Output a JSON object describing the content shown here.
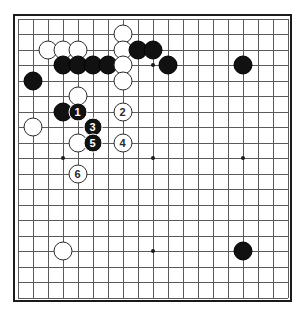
{
  "figure": {
    "kind": "go-board-diagram",
    "title": "",
    "board_size": 19,
    "colors": {
      "background": "#ffffff",
      "board": "#ffffff",
      "border": "#1b1b1b",
      "grid_line": "#5a5a5a",
      "black_stone": "#111111",
      "white_stone": "#ffffff",
      "white_stone_outline": "#2a2a2a",
      "star_point": "#1b1b1b",
      "black_label_text": "#ffffff",
      "white_label_text": "#2a2a2a"
    }
  },
  "chart_data": {
    "type": "table",
    "xlabel": "board column (0 = left edge, 18 = right edge)",
    "ylabel": "board row (0 = top edge, 18 = bottom edge)",
    "board_size": 19,
    "star_points": [
      {
        "col": 3,
        "row": 3
      },
      {
        "col": 9,
        "row": 3
      },
      {
        "col": 15,
        "row": 3
      },
      {
        "col": 3,
        "row": 9
      },
      {
        "col": 9,
        "row": 9
      },
      {
        "col": 15,
        "row": 9
      },
      {
        "col": 3,
        "row": 15
      },
      {
        "col": 9,
        "row": 15
      },
      {
        "col": 15,
        "row": 15
      }
    ],
    "stones": [
      {
        "color": "white",
        "col": 7,
        "row": 1,
        "label": ""
      },
      {
        "color": "white",
        "col": 2,
        "row": 2,
        "label": ""
      },
      {
        "color": "white",
        "col": 3,
        "row": 2,
        "label": ""
      },
      {
        "color": "white",
        "col": 4,
        "row": 2,
        "label": ""
      },
      {
        "color": "white",
        "col": 7,
        "row": 2,
        "label": ""
      },
      {
        "color": "black",
        "col": 8,
        "row": 2,
        "label": ""
      },
      {
        "color": "black",
        "col": 9,
        "row": 2,
        "label": ""
      },
      {
        "color": "black",
        "col": 3,
        "row": 3,
        "label": ""
      },
      {
        "color": "black",
        "col": 4,
        "row": 3,
        "label": ""
      },
      {
        "color": "black",
        "col": 5,
        "row": 3,
        "label": ""
      },
      {
        "color": "black",
        "col": 6,
        "row": 3,
        "label": ""
      },
      {
        "color": "white",
        "col": 7,
        "row": 3,
        "label": ""
      },
      {
        "color": "black",
        "col": 10,
        "row": 3,
        "label": ""
      },
      {
        "color": "black",
        "col": 15,
        "row": 3,
        "label": ""
      },
      {
        "color": "black",
        "col": 1,
        "row": 4,
        "label": ""
      },
      {
        "color": "white",
        "col": 7,
        "row": 4,
        "label": ""
      },
      {
        "color": "white",
        "col": 4,
        "row": 5,
        "label": ""
      },
      {
        "color": "black",
        "col": 3,
        "row": 6,
        "label": ""
      },
      {
        "color": "black",
        "col": 4,
        "row": 6,
        "label": "1"
      },
      {
        "color": "white",
        "col": 7,
        "row": 6,
        "label": "2"
      },
      {
        "color": "white",
        "col": 1,
        "row": 7,
        "label": ""
      },
      {
        "color": "black",
        "col": 5,
        "row": 7,
        "label": "3"
      },
      {
        "color": "white",
        "col": 4,
        "row": 8,
        "label": ""
      },
      {
        "color": "black",
        "col": 5,
        "row": 8,
        "label": "5"
      },
      {
        "color": "white",
        "col": 7,
        "row": 8,
        "label": "4"
      },
      {
        "color": "white",
        "col": 4,
        "row": 10,
        "label": "6"
      },
      {
        "color": "white",
        "col": 3,
        "row": 15,
        "label": ""
      },
      {
        "color": "black",
        "col": 15,
        "row": 15,
        "label": ""
      }
    ],
    "move_sequence": [
      {
        "move": "1",
        "color": "black",
        "col": 4,
        "row": 6
      },
      {
        "move": "2",
        "color": "white",
        "col": 7,
        "row": 6
      },
      {
        "move": "3",
        "color": "black",
        "col": 5,
        "row": 7
      },
      {
        "move": "4",
        "color": "white",
        "col": 7,
        "row": 8
      },
      {
        "move": "5",
        "color": "black",
        "col": 5,
        "row": 8
      },
      {
        "move": "6",
        "color": "white",
        "col": 4,
        "row": 10
      }
    ]
  }
}
